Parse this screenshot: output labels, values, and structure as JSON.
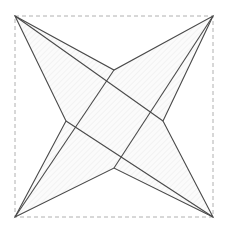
{
  "figure": {
    "canvas": {
      "width": 228,
      "height": 232
    },
    "background_color": "#ffffff",
    "bounding_box": {
      "label": "dashed bounding rectangle",
      "x": 15,
      "y": 16,
      "width": 198,
      "height": 201,
      "stroke_color": "#b0b0b0",
      "stroke_width": 1,
      "dash_pattern": "4 3",
      "fill": "none"
    },
    "star": {
      "label": "concave four-pointed star polygon",
      "stroke_color": "#4a4a4a",
      "stroke_width": 1.1,
      "fill_color": "#fbfbfb",
      "hatch": {
        "label": "diagonal hatch fill",
        "angle_degrees": 45,
        "spacing": 4,
        "stroke_color": "#e2e2e2",
        "stroke_width": 0.7
      },
      "outer_points": [
        {
          "name": "tip-top-left",
          "x": 15,
          "y": 16
        },
        {
          "name": "tip-top-right",
          "x": 213,
          "y": 16
        },
        {
          "name": "tip-bottom-right",
          "x": 213,
          "y": 217
        },
        {
          "name": "tip-bottom-left",
          "x": 15,
          "y": 217
        }
      ],
      "inner_points": [
        {
          "name": "notch-top",
          "x": 114,
          "y": 70
        },
        {
          "name": "notch-right",
          "x": 163,
          "y": 121
        },
        {
          "name": "notch-bottom",
          "x": 114,
          "y": 168
        },
        {
          "name": "notch-left",
          "x": 66,
          "y": 121
        }
      ],
      "polygon_path": "15,16 114,70 213,16 163,121 213,217 114,168 15,217 66,121",
      "chords": [
        {
          "name": "chord-top-left-to-notch-right",
          "x1": 15,
          "y1": 16,
          "x2": 163,
          "y2": 121
        },
        {
          "name": "chord-top-right-to-notch-bottom",
          "x1": 213,
          "y1": 16,
          "x2": 114,
          "y2": 168
        },
        {
          "name": "chord-bottom-right-to-notch-left",
          "x1": 213,
          "y1": 217,
          "x2": 66,
          "y2": 121
        },
        {
          "name": "chord-bottom-left-to-notch-top",
          "x1": 15,
          "y1": 217,
          "x2": 114,
          "y2": 70
        }
      ]
    }
  }
}
